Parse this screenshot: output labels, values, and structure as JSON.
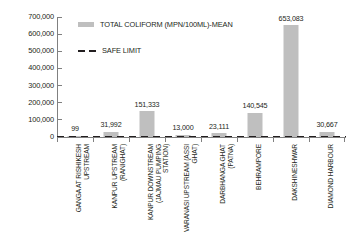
{
  "chart_data": {
    "type": "bar",
    "title": "",
    "subtitle": "",
    "xlabel": "",
    "ylabel": "",
    "ylim": [
      0,
      700000
    ],
    "y_ticks": [
      "0",
      "100,000",
      "200,000",
      "300,000",
      "400,000",
      "500,000",
      "600,000",
      "700,000"
    ],
    "y_tick_values": [
      0,
      100000,
      200000,
      300000,
      400000,
      500000,
      600000,
      700000
    ],
    "grid": false,
    "legend_position": "upper-left-inside",
    "categories": [
      "GANGA AT RISHIKESH UPSTREAM",
      "KANPUR UPSTREAM (RANIGHAT)",
      "KANPUR DOWNSTREAM (JAJMAU PUMPING STATION)",
      "VARANASI UPSTREAM (ASSI GHAT)",
      "DARBHANGA GHAT (PATNA)",
      "BEHRAMPORE",
      "DAKSHINESHWAR",
      "DIAMOND HARBOUR"
    ],
    "categories_display": [
      "GANGA AT RISHIKESH\nUPSTREAM",
      "KANPUR UPSTREAM\n(RANIGHAT)",
      "KANPUR DOWNSTREAM\n(JAJMAU PUMPING\nSTATION)",
      "VARANASI UPSTREAM (ASSI\nGHAT)",
      "DARBHANGA GHAT\n(PATNA)",
      "BEHRAMPORE",
      "DAKSHINESHWAR",
      "DIAMOND HARBOUR"
    ],
    "values": [
      99,
      31992,
      151333,
      13000,
      23111,
      140545,
      653083,
      30667
    ],
    "value_labels": [
      "99",
      "31,992",
      "151,333",
      "13,000",
      "23,111",
      "140,545",
      "653,083",
      "30,667"
    ],
    "series": [
      {
        "name": "TOTAL COLIFORM (MPN/100ML)-MEAN",
        "type": "bar",
        "color": "#BFBFBF",
        "values": [
          99,
          31992,
          151333,
          13000,
          23111,
          140545,
          653083,
          30667
        ]
      },
      {
        "name": "SAFE LIMIT",
        "type": "line",
        "style": "dashed",
        "color": "#231F20",
        "value": 2500,
        "values": [
          2500,
          2500,
          2500,
          2500,
          2500,
          2500,
          2500,
          2500
        ]
      }
    ]
  },
  "legend": {
    "bar_label": "TOTAL COLIFORM (MPN/100ML)-MEAN",
    "line_label": "SAFE LIMIT"
  },
  "colors": {
    "bar": "#BFBFBF",
    "safe_limit": "#231F20",
    "axis": "#808080",
    "text": "#231F20",
    "background": "#FFFFFF"
  }
}
